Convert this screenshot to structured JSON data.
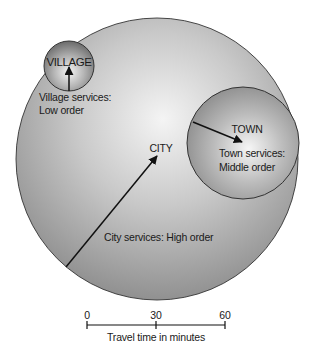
{
  "diagram": {
    "type": "central-place-hierarchy",
    "settlements": [
      {
        "name": "CITY",
        "services_line1": "City services: High order",
        "services_line2": ""
      },
      {
        "name": "TOWN",
        "services_line1": "Town services:",
        "services_line2": "Middle order"
      },
      {
        "name": "VILLAGE",
        "services_line1": "Village services:",
        "services_line2": "Low order"
      }
    ],
    "colors": {
      "fill_center": "#f2f2f2",
      "fill_edge": "#8e8e8e",
      "outline": "#333333",
      "arrow": "#111111",
      "text": "#1a1a1a"
    }
  },
  "labels": {
    "city": "CITY",
    "city_services": "City services: High order",
    "town": "TOWN",
    "town_services_1": "Town services:",
    "town_services_2": "Middle order",
    "village": "VILLAGE",
    "village_services_1": "Village services:",
    "village_services_2": "Low order"
  },
  "scale": {
    "ticks": [
      "0",
      "30",
      "60"
    ],
    "caption": "Travel time in minutes",
    "unit": "minutes"
  }
}
